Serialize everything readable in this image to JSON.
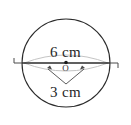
{
  "figure": {
    "type": "circle-geometry-diagram",
    "background_color": "#ffffff",
    "stroke_color": "#2b2b2b",
    "faint_stroke_color": "#b3b3b3",
    "text_color": "#262626",
    "circle": {
      "center_x": 66,
      "center_y": 63,
      "radius_px": 44
    },
    "center_point": {
      "label": "O",
      "x": 66,
      "y": 63
    },
    "diameter": {
      "label": "6 cm",
      "value": 6,
      "unit": "cm",
      "start_x": 22,
      "end_x": 110,
      "y": 63
    },
    "radius": {
      "label": "3 cm",
      "value": 3,
      "unit": "cm"
    },
    "end_ticks": {
      "left": "left-end-tick",
      "right": "right-end-tick"
    }
  }
}
